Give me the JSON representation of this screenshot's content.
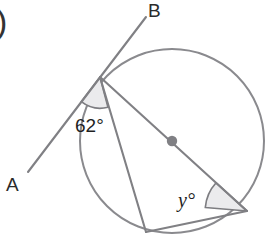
{
  "figure": {
    "kind": "circle-geometry-diagram",
    "background_color": "#ffffff",
    "line_color": "#808084",
    "shade_color": "#ebebed",
    "text_color": "#1f1f1f"
  },
  "question_marker": {
    "label": ")"
  },
  "labels": {
    "point_a": "A",
    "point_b": "B"
  },
  "angles": {
    "tangent_chord": {
      "value": "62",
      "degree_symbol": "°",
      "text": "62°"
    },
    "inscribed": {
      "variable": "y",
      "degree_symbol": "°",
      "text": "y°"
    }
  },
  "geometry": {
    "circle": {
      "cx": 172,
      "cy": 141,
      "r": 92
    },
    "center_dot": {
      "cx": 172,
      "cy": 141,
      "r": 5.2
    },
    "tangent_point": {
      "x": 100,
      "y": 77
    },
    "tangent_end_a": {
      "x": 28,
      "y": 172
    },
    "tangent_end_b": {
      "x": 146,
      "y": 17
    },
    "diameter_end": {
      "x": 247,
      "y": 211
    },
    "chord_bottom": {
      "x": 146,
      "y": 232
    }
  }
}
